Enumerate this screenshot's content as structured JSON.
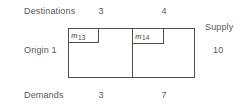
{
  "figure": {
    "type": "transportation-tableau",
    "row_header_label": "Destinations",
    "origin_label": "Origin 1",
    "demands_label": "Demands",
    "supply_label": "Supply",
    "supply_value": "10",
    "destinations": [
      {
        "index": "3",
        "demand": "3",
        "variable_base": "m",
        "variable_subscript": "13"
      },
      {
        "index": "4",
        "demand": "7",
        "variable_base": "m",
        "variable_subscript": "14"
      }
    ],
    "colors": {
      "line": "#4f4f4f",
      "text": "#585858",
      "variable_text": "#4a4a4a",
      "background": "#ffffff"
    }
  }
}
